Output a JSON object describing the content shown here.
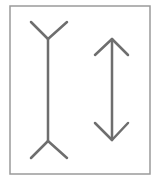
{
  "figure": {
    "name": "Muller-Lyer illusion",
    "border_color": "#9a9a9a",
    "line_color": "#6e6e6e",
    "frame": {
      "x": 10,
      "y": 6,
      "w": 140,
      "h": 168
    },
    "left_figure": {
      "shaft": {
        "x": 48,
        "y1": 39,
        "y2": 141
      },
      "top_fork": [
        [
          31,
          22
        ],
        [
          48,
          39
        ],
        [
          67,
          22
        ]
      ],
      "bottom_fork": [
        [
          31,
          158
        ],
        [
          48,
          141
        ],
        [
          67,
          158
        ]
      ]
    },
    "right_figure": {
      "shaft": {
        "x": 112,
        "y1": 39,
        "y2": 140
      },
      "top_arrowhead": [
        [
          95,
          55
        ],
        [
          112,
          39
        ],
        [
          128,
          55
        ]
      ],
      "bottom_arrowhead": [
        [
          95,
          123
        ],
        [
          112,
          140
        ],
        [
          128,
          123
        ]
      ]
    }
  }
}
